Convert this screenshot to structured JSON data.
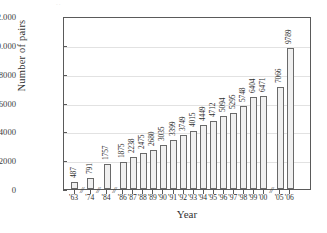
{
  "chart_data": {
    "type": "bar",
    "title": "",
    "xlabel": "Year",
    "ylabel": "Number of pairs",
    "ylim": [
      0,
      12000
    ],
    "grid": true,
    "legend": null,
    "categories": [
      "'63",
      "'74",
      "'84",
      "'86",
      "'87",
      "'88",
      "'89",
      "'90",
      "'91",
      "'92",
      "'93",
      "'94",
      "'95",
      "'96",
      "'97",
      "'98",
      "'99",
      "'00",
      "'05",
      "'06"
    ],
    "values": [
      487,
      791,
      1757,
      1875,
      2238,
      2475,
      2680,
      3035,
      3399,
      3749,
      4015,
      4449,
      4712,
      5094,
      5295,
      5748,
      6404,
      6471,
      7066,
      9789
    ],
    "data_labels": [
      "487",
      "791",
      "1757",
      "1875",
      "2238",
      "2475",
      "2680",
      "3035",
      "3399",
      "3749",
      "4015",
      "4449",
      "4712",
      "5094",
      "5295",
      "5748",
      "6404",
      "6471",
      "7066",
      "9789"
    ],
    "yticks": [
      {
        "value": 12000,
        "label": "12.000"
      },
      {
        "value": 10000,
        "label": "10.000"
      },
      {
        "value": 8000,
        "label": "8000"
      },
      {
        "value": 6000,
        "label": "6000"
      },
      {
        "value": 4000,
        "label": "4000"
      },
      {
        "value": 2000,
        "label": "2000"
      },
      {
        "value": 0,
        "label": "0"
      }
    ],
    "axis_breaks": [
      {
        "after_category": "'63",
        "symbol": "//"
      },
      {
        "after_category": "'74",
        "symbol": "//"
      },
      {
        "after_category": "'84",
        "symbol": "//"
      },
      {
        "after_category": "'00",
        "symbol": "//"
      }
    ],
    "colors": {
      "bar_fill": "#f0f0f0",
      "bar_stroke": "#6a6a6a",
      "axis": "#5a5a5a",
      "grid": "#e2e2e2",
      "text": "#2f2f2f"
    }
  }
}
